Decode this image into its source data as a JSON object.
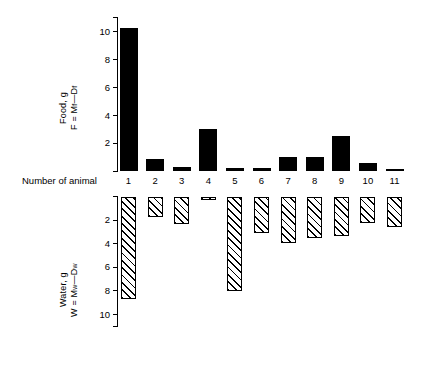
{
  "figure": {
    "x_axis_title": "Number of animal",
    "categories": [
      "1",
      "2",
      "3",
      "4",
      "5",
      "6",
      "7",
      "8",
      "9",
      "10",
      "11"
    ]
  },
  "food_panel": {
    "axis_label_line1": "Food, g",
    "axis_label_line2_prefix": "F = M",
    "axis_label_line2_sub1": "f",
    "axis_label_line2_mid": "—D",
    "axis_label_line2_sub2": "f",
    "ticks": [
      "10",
      "8",
      "6",
      "4",
      "2"
    ],
    "tick_values": [
      10,
      8,
      6,
      4,
      2
    ]
  },
  "water_panel": {
    "axis_label_line1": "Water, g",
    "axis_label_line2_prefix": "W = M",
    "axis_label_line2_sub1": "w",
    "axis_label_line2_mid": "—D",
    "axis_label_line2_sub2": "w",
    "ticks": [
      "2",
      "4",
      "6",
      "8",
      "10"
    ],
    "tick_values": [
      2,
      4,
      6,
      8,
      10
    ]
  },
  "chart_data": [
    {
      "type": "bar",
      "title": "Food consumed per animal",
      "xlabel": "Number of animal",
      "ylabel": "Food, g   F = Mf—Df",
      "categories": [
        "1",
        "2",
        "3",
        "4",
        "5",
        "6",
        "7",
        "8",
        "9",
        "10",
        "11"
      ],
      "values": [
        10.3,
        0.85,
        0.3,
        3.05,
        0.25,
        0.25,
        1.05,
        1.0,
        2.5,
        0.6,
        0.15
      ],
      "ylim": [
        0,
        11
      ],
      "yticks": [
        2,
        4,
        6,
        8,
        10
      ],
      "grid": false,
      "legend": "none",
      "bar_style": "solid-black",
      "direction": "up"
    },
    {
      "type": "bar",
      "title": "Water consumed per animal",
      "xlabel": "Number of animal",
      "ylabel": "Water, g   W = Mw—Dw",
      "categories": [
        "1",
        "2",
        "3",
        "4",
        "5",
        "6",
        "7",
        "8",
        "9",
        "10",
        "11"
      ],
      "values": [
        8.7,
        1.7,
        2.3,
        0.3,
        8.0,
        3.1,
        3.9,
        3.5,
        3.3,
        2.2,
        2.6
      ],
      "ylim": [
        0,
        11
      ],
      "yticks": [
        2,
        4,
        6,
        8,
        10
      ],
      "grid": false,
      "legend": "none",
      "bar_style": "diagonal-hatch",
      "direction": "down"
    }
  ]
}
